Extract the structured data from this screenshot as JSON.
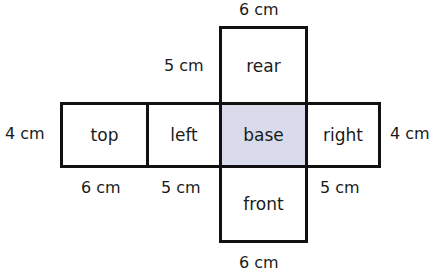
{
  "diagram": {
    "type": "net of cuboid",
    "colors": {
      "base_fill": "#d9dbec",
      "stroke": "#111111"
    },
    "faces": {
      "rear": "rear",
      "top": "top",
      "left": "left",
      "base": "base",
      "right": "right",
      "front": "front"
    },
    "dimensions": {
      "top_width": "6 cm",
      "rear_height": "5 cm",
      "left_height": "4 cm",
      "right_height": "4 cm",
      "top_face_width": "6 cm",
      "left_face_width": "5 cm",
      "right_face_width": "5 cm",
      "bottom_width": "6 cm"
    }
  }
}
